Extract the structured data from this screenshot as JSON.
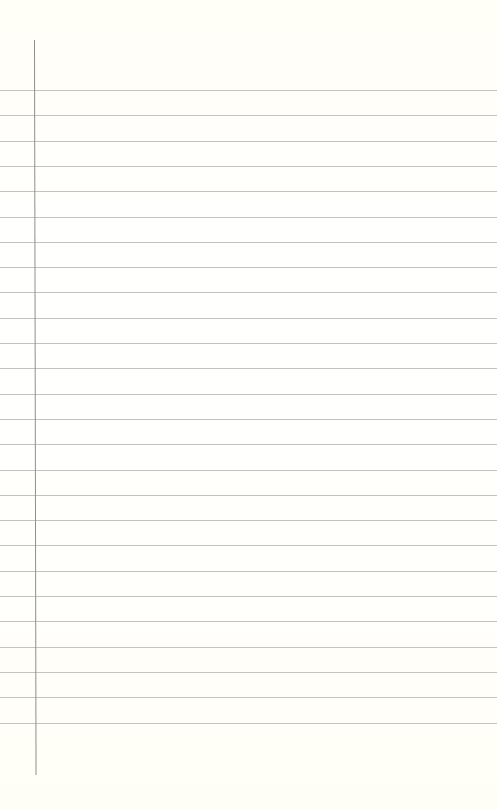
{
  "paper": {
    "type": "lined-notebook-paper",
    "background_color": "#fffffb",
    "rule_color": "#b9b9b6",
    "margin_line_color": "#8f8f8c",
    "rule_count": 26,
    "first_rule_y": 90,
    "rule_spacing": 25.3,
    "margin_line": {
      "x": 34,
      "y_start": 40,
      "y_end": 775
    },
    "content": ""
  }
}
